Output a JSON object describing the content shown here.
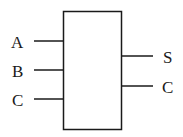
{
  "diagram": {
    "type": "logic-block",
    "inputs": [
      {
        "label": "A",
        "y": 41
      },
      {
        "label": "B",
        "y": 70
      },
      {
        "label": "C",
        "y": 99
      }
    ],
    "outputs": [
      {
        "label": "S",
        "y": 56
      },
      {
        "label": "C",
        "y": 86
      }
    ],
    "colors": {
      "stroke": "#1a1a1a",
      "background": "#ffffff"
    }
  }
}
